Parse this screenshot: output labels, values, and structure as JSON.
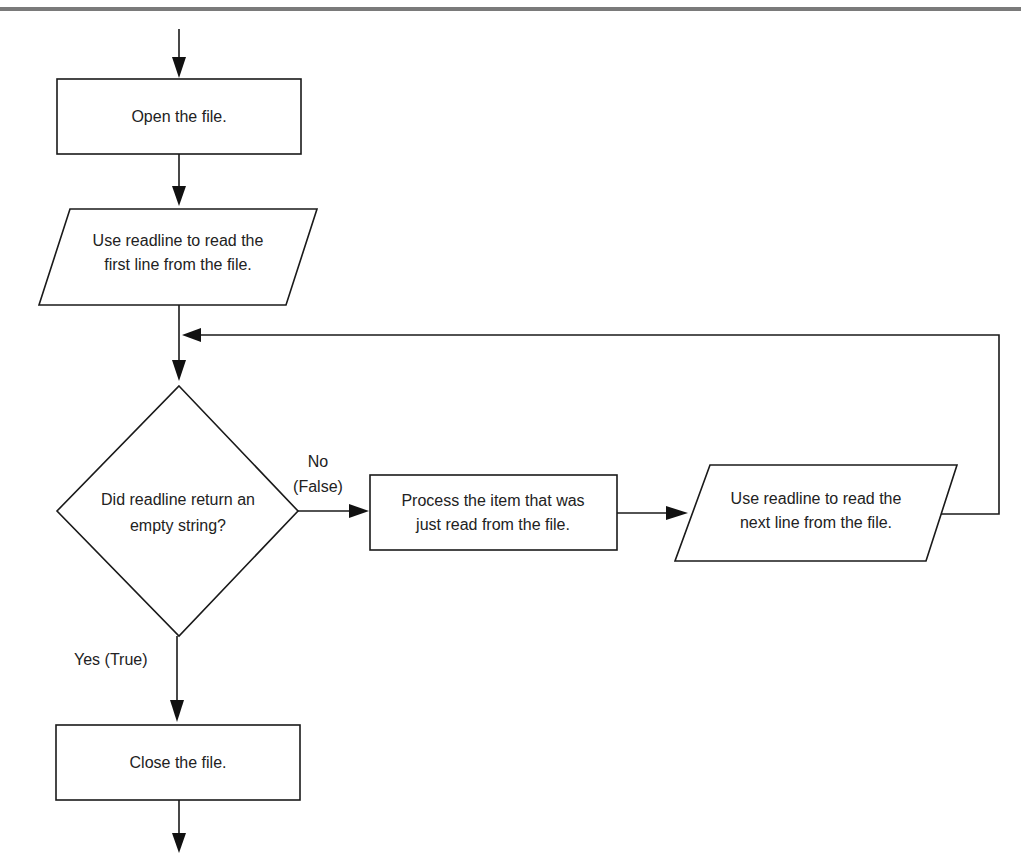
{
  "diagram": {
    "type": "flowchart",
    "nodes": {
      "open": {
        "shape": "process",
        "label": "Open the file."
      },
      "read_first": {
        "shape": "input-output",
        "line1": "Use readline to read the",
        "line2": "first line from the file."
      },
      "decision": {
        "shape": "decision",
        "line1": "Did readline return an",
        "line2": "empty string?"
      },
      "process_item": {
        "shape": "process",
        "line1": "Process the item that was",
        "line2": "just read from the file."
      },
      "read_next": {
        "shape": "input-output",
        "line1": "Use readline to read the",
        "line2": "next line from the file."
      },
      "close": {
        "shape": "process",
        "label": "Close the file."
      }
    },
    "edges": {
      "no_label_line1": "No",
      "no_label_line2": "(False)",
      "yes_label": "Yes (True)"
    },
    "colors": {
      "stroke": "#1a1a1a",
      "fill": "#ffffff",
      "rule": "#7a7a7a"
    }
  }
}
